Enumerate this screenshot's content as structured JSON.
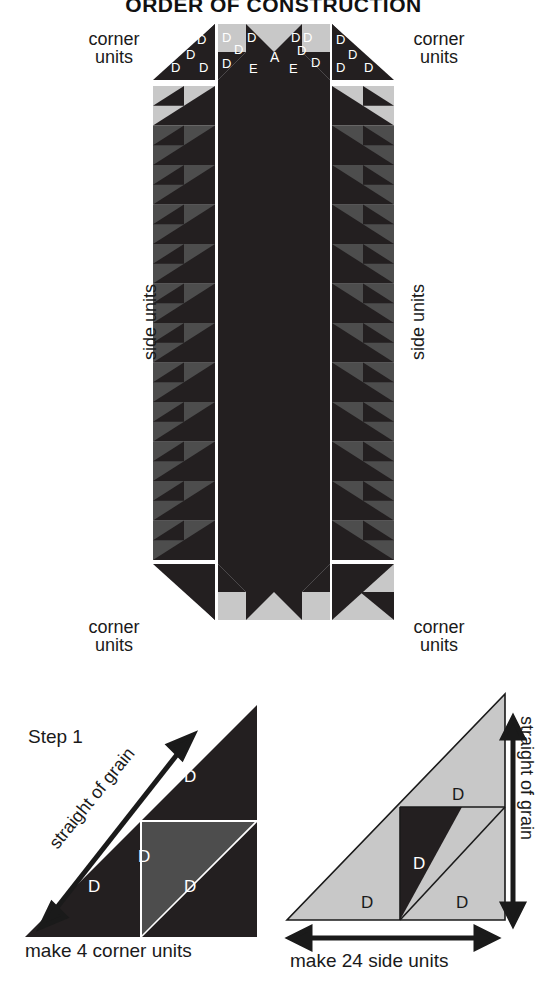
{
  "title": "ORDER OF CONSTRUCTION",
  "colors": {
    "dark": "#231f20",
    "medium": "#4d4d4d",
    "light": "#c8c8c8",
    "background": "#ffffff",
    "text": "#1a1a1a",
    "label_on_dark": "#ffffff"
  },
  "assembly": {
    "labels": {
      "corner_units_top_left": "corner\nunits",
      "corner_units_top_right": "corner\nunits",
      "corner_units_bottom_left": "corner\nunits",
      "corner_units_bottom_right": "corner\nunits",
      "side_units_left": "side units",
      "side_units_right": "side units",
      "corner_line1": "corner",
      "corner_line2": "units",
      "side_units": "side units"
    },
    "piece_labels": {
      "center": "A",
      "setting_triangle": "E",
      "small_triangle": "D"
    },
    "top_left_corner_unit_letters": [
      "D",
      "D",
      "D",
      "D"
    ],
    "top_right_corner_unit_letters": [
      "D",
      "D",
      "D",
      "D"
    ],
    "top_center_left_letters": [
      "D",
      "D",
      "D",
      "D",
      "E"
    ],
    "top_center_right_letters": [
      "D",
      "D",
      "D",
      "E"
    ],
    "center_letter": "A",
    "side_unit_count_left": 12,
    "side_unit_count_right": 12
  },
  "step1": {
    "step_label": "Step 1",
    "grain_label": "straight of grain",
    "caption": "make 4 corner units",
    "piece_letters": [
      "D",
      "D",
      "D",
      "D"
    ],
    "letter": "D"
  },
  "step_side": {
    "grain_label": "straight of grain",
    "caption": "make 24 side units",
    "piece_letters": [
      "D",
      "D",
      "D",
      "D"
    ],
    "letter": "D"
  }
}
